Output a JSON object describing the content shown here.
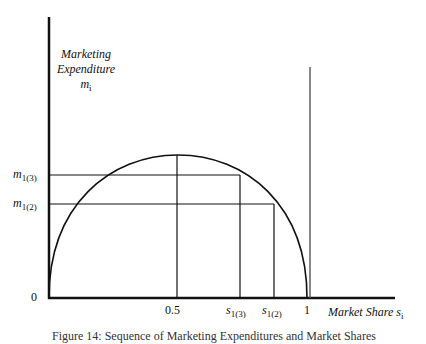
{
  "diagram": {
    "y_axis_label": {
      "line1": "Marketing",
      "line2": "Expenditure",
      "symbol": "m",
      "symbol_sub": "i"
    },
    "x_axis_label": {
      "text": "Market Share",
      "symbol": "s",
      "symbol_sub": "i"
    },
    "origin_label": "0",
    "x_ticks": [
      {
        "label": "0.5"
      },
      {
        "label": "s",
        "sub": "1(3)"
      },
      {
        "label": "s",
        "sub": "1(2)"
      },
      {
        "label": "1"
      }
    ],
    "y_ticks": [
      {
        "label": "m",
        "sub": "1(3)"
      },
      {
        "label": "m",
        "sub": "1(2)"
      }
    ],
    "caption": "Figure 14: Sequence of Marketing Expenditures and Market Shares",
    "colors": {
      "line": "#111111",
      "background": "#ffffff"
    }
  }
}
